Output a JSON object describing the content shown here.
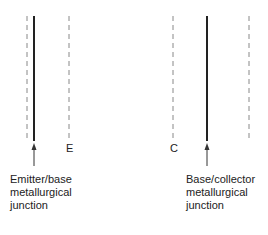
{
  "diagram": {
    "letters": {
      "emitter": "E",
      "collector": "C"
    },
    "labels": {
      "emitter_junction": [
        "Emitter/base",
        "metallurgical",
        "junction"
      ],
      "collector_junction": [
        "Base/collector",
        "metallurgical",
        "junction"
      ]
    },
    "colors": {
      "line": "#222222",
      "dashed": "#777777"
    }
  }
}
